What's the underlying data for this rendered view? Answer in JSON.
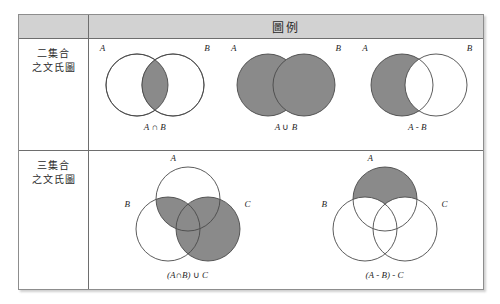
{
  "figure": {
    "header": {
      "title": "圖例"
    },
    "rows": [
      {
        "label_lines": [
          "二集合",
          "之文氏圖"
        ],
        "diagrams": [
          {
            "caption": "A ∩ B",
            "caption_left": "A",
            "caption_op": " ∩ ",
            "caption_right": "B",
            "set_labels": [
              "A",
              "B"
            ],
            "shaded_region": "intersection"
          },
          {
            "caption": "A ∪ B",
            "caption_left": "A",
            "caption_op": " ∪ ",
            "caption_right": "B",
            "set_labels": [
              "A",
              "B"
            ],
            "shaded_region": "union"
          },
          {
            "caption": "A - B",
            "caption_left": "A",
            "caption_op": " - ",
            "caption_right": "B",
            "set_labels": [
              "A",
              "B"
            ],
            "shaded_region": "difference"
          }
        ]
      },
      {
        "label_lines": [
          "三集合",
          "之文氏圖"
        ],
        "diagrams": [
          {
            "caption": "(A∩B) ∪ C",
            "caption_left": "(A∩B)",
            "caption_op": " ∪ ",
            "caption_right": "C",
            "set_labels": [
              "A",
              "B",
              "C"
            ],
            "shaded_region": "a-and-b-union-c"
          },
          {
            "caption": "(A - B) - C",
            "caption_left": "(A - B)",
            "caption_op": " - ",
            "caption_right": "C",
            "set_labels": [
              "A",
              "B",
              "C"
            ],
            "shaded_region": "a-minus-b-minus-c"
          }
        ]
      }
    ],
    "colors": {
      "shade": "#8a8a8a",
      "outline": "#4a4a4a",
      "header_background": "#d2d2d2",
      "border": "#6e6e6e"
    }
  }
}
